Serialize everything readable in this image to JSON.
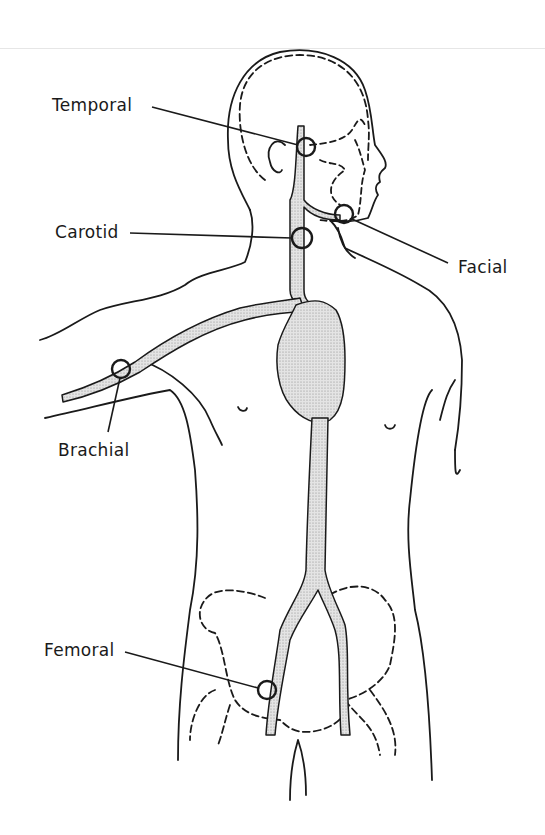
{
  "diagram": {
    "colors": {
      "line": "#1a1a1a",
      "artery_fill": "#d4d4d4",
      "background": "#ffffff"
    },
    "labels": [
      {
        "id": "temporal",
        "text": "Temporal"
      },
      {
        "id": "carotid",
        "text": "Carotid"
      },
      {
        "id": "facial",
        "text": "Facial"
      },
      {
        "id": "brachial",
        "text": "Brachial"
      },
      {
        "id": "femoral",
        "text": "Femoral"
      }
    ]
  }
}
